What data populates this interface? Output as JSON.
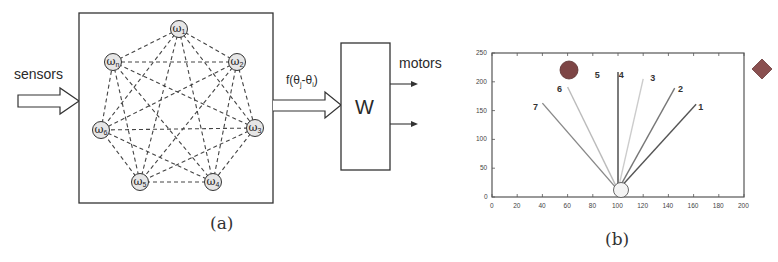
{
  "panel_a": {
    "caption": "(a)",
    "input_label": "sensors",
    "transfer_label": "f(θj-θi)",
    "transfer_label_parts": {
      "f": "f(θ",
      "j": "j",
      "mid": "-θ",
      "i": "i",
      "end": ")"
    },
    "weight_block_label": "W",
    "output_label": "motors",
    "oscillator_nodes": [
      {
        "id": "w1",
        "symbol": "ω",
        "sub": "1",
        "cx": 179,
        "cy": 29
      },
      {
        "id": "w2",
        "symbol": "ω",
        "sub": "2",
        "cx": 237,
        "cy": 62
      },
      {
        "id": "w3",
        "symbol": "ω",
        "sub": "3",
        "cx": 255,
        "cy": 128
      },
      {
        "id": "w4",
        "symbol": "ω",
        "sub": "4",
        "cx": 213,
        "cy": 182
      },
      {
        "id": "w5",
        "symbol": "ω",
        "sub": "5",
        "cx": 140,
        "cy": 182
      },
      {
        "id": "w6",
        "symbol": "ω",
        "sub": "6",
        "cx": 101,
        "cy": 130
      },
      {
        "id": "wn",
        "symbol": "ω",
        "sub": "n",
        "cx": 113,
        "cy": 62
      }
    ],
    "connections": "all-to-all (dashed)",
    "motor_outputs": 2
  },
  "panel_b": {
    "caption": "(b)",
    "chart_data": {
      "type": "line",
      "title": "",
      "xlabel": "",
      "ylabel": "",
      "xlim": [
        0,
        200
      ],
      "ylim": [
        0,
        250
      ],
      "x_ticks": [
        "0",
        "20",
        "40",
        "60",
        "80",
        "100",
        "120",
        "140",
        "160",
        "180",
        "200"
      ],
      "y_ticks": [
        "0",
        "50",
        "100",
        "150",
        "200",
        "250"
      ],
      "grid": false,
      "origin": {
        "x": 100,
        "y": 12
      },
      "series": [
        {
          "name": "1",
          "x": [
            100,
            162
          ],
          "y": [
            12,
            161
          ],
          "color": "#555555"
        },
        {
          "name": "2",
          "x": [
            100,
            145
          ],
          "y": [
            12,
            189
          ],
          "color": "#777777"
        },
        {
          "name": "3",
          "x": [
            100,
            120
          ],
          "y": [
            12,
            205
          ],
          "color": "#cccccc"
        },
        {
          "name": "4",
          "x": [
            100,
            100
          ],
          "y": [
            12,
            217
          ],
          "color": "#444444"
        },
        {
          "name": "5",
          "x": [
            100,
            100
          ],
          "y": [
            12,
            12
          ],
          "color": "#ffffff"
        },
        {
          "name": "6",
          "x": [
            100,
            60
          ],
          "y": [
            12,
            191
          ],
          "color": "#bbbbbb"
        },
        {
          "name": "7",
          "x": [
            100,
            40
          ],
          "y": [
            12,
            163
          ],
          "color": "#888888"
        }
      ],
      "annotations": [
        {
          "text": "1",
          "x": 166,
          "y": 155
        },
        {
          "text": "2",
          "x": 150,
          "y": 186
        },
        {
          "text": "3",
          "x": 128,
          "y": 205
        },
        {
          "text": "4",
          "x": 103,
          "y": 210
        },
        {
          "text": "5",
          "x": 84,
          "y": 210
        },
        {
          "text": "6",
          "x": 54,
          "y": 186
        },
        {
          "text": "7",
          "x": 35,
          "y": 155
        }
      ],
      "objects": [
        {
          "type": "ball",
          "x": 61,
          "y": 220,
          "color": "#8a4a4a"
        },
        {
          "type": "robot",
          "x": 101,
          "y": 12,
          "color": "#f0f0f0"
        },
        {
          "type": "diamond-target",
          "x": 214,
          "y": 222,
          "color": "#8a5050"
        }
      ]
    }
  }
}
